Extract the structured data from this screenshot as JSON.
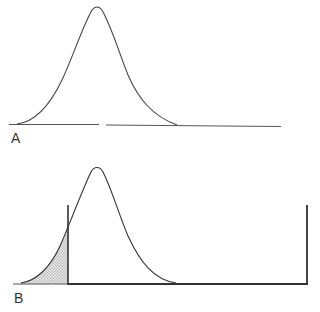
{
  "panels": [
    {
      "id": "A",
      "label": "A",
      "description": "Bell-shaped distribution curve on a baseline",
      "curve": {
        "mean_x": 97,
        "peak_y": 7,
        "baseline_y": 125,
        "start_x": 17,
        "end_x": 177
      },
      "baseline": {
        "x1": 9,
        "x2": 281
      }
    },
    {
      "id": "B",
      "label": "B",
      "description": "Same distribution with a threshold line; left tail area shaded (stippled), bounded by vertical lines",
      "curve": {
        "mean_x": 97,
        "peak_y": 168,
        "baseline_y": 284,
        "start_x": 21,
        "end_x": 176
      },
      "baseline": {
        "x1": 13,
        "x2": 308
      },
      "threshold_line_x": 68,
      "right_bound_x": 307,
      "vertical_top_y": 205,
      "shaded_region": "left tail (x < threshold)"
    }
  ],
  "colors": {
    "line": "#3a3a3a",
    "shade": "#b0b0b0",
    "background": "#ffffff"
  }
}
